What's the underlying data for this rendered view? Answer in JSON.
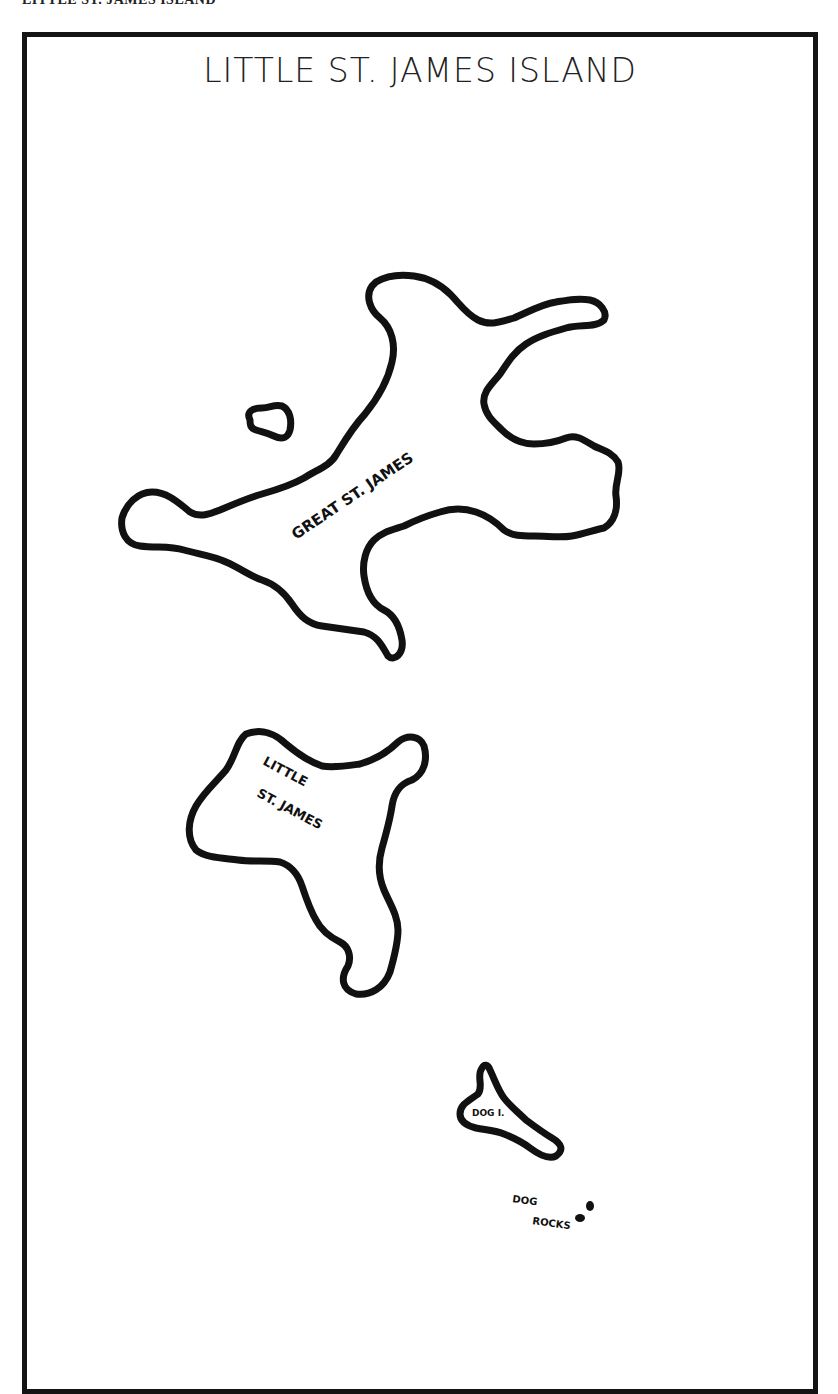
{
  "page": {
    "top_caption": "LITTLE ST. JAMES ISLAND"
  },
  "map": {
    "title": "LITTLE ST. JAMES ISLAND",
    "style": {
      "border_color": "#141414",
      "coast_color": "#111111",
      "background": "#ffffff"
    },
    "features": [
      {
        "name": "great-st-james",
        "label": "GREAT ST. JAMES",
        "type": "island"
      },
      {
        "name": "islet",
        "label": "",
        "type": "islet"
      },
      {
        "name": "little-st-james",
        "label_lines": [
          "LITTLE",
          "ST. JAMES"
        ],
        "type": "island"
      },
      {
        "name": "dog-island",
        "label": "DOG I.",
        "type": "island"
      },
      {
        "name": "dog-rocks",
        "label_lines": [
          "DOG",
          "ROCKS"
        ],
        "type": "rocks"
      }
    ]
  }
}
